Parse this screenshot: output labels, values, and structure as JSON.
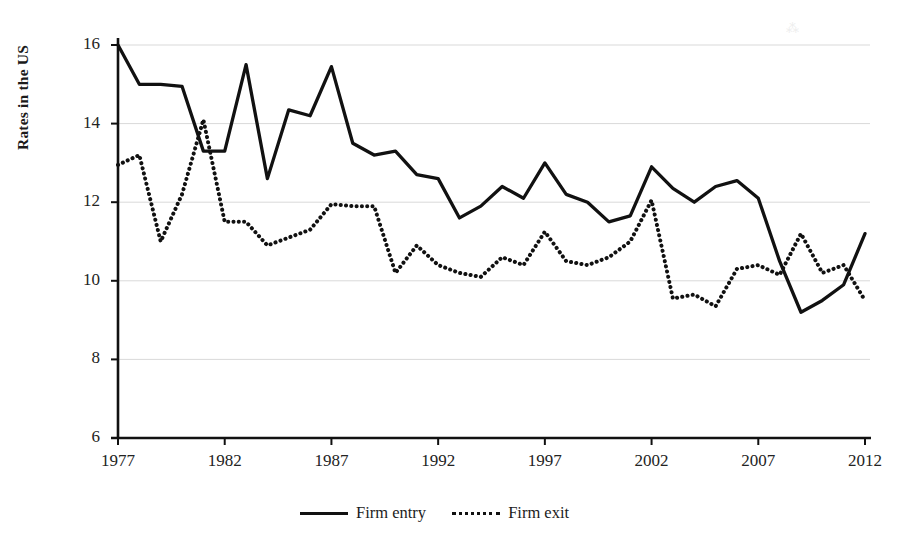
{
  "figure": {
    "background": "#ffffff",
    "ink_color": "#111111",
    "grid_color": "#d9d9d9",
    "axis_color": "#111111"
  },
  "axes": {
    "ylabel": "Rates in the US",
    "yticks": [
      6,
      8,
      10,
      12,
      14,
      16
    ],
    "xticks": [
      1977,
      1982,
      1987,
      1992,
      1997,
      2002,
      2007,
      2012
    ]
  },
  "legend": {
    "position": "bottom-center",
    "entries": [
      {
        "label": "Firm entry",
        "style": "solid",
        "color": "#111111"
      },
      {
        "label": "Firm exit",
        "style": "dotted",
        "color": "#111111"
      }
    ]
  },
  "artifact": {
    "glyph": "⁂"
  },
  "chart_data": {
    "type": "line",
    "title": "",
    "subtitle": "",
    "xlabel": "",
    "ylabel": "Rates in the US",
    "xlim": [
      1977,
      2012
    ],
    "ylim": [
      6,
      16
    ],
    "xticks": [
      1977,
      1982,
      1987,
      1992,
      1997,
      2002,
      2007,
      2012
    ],
    "yticks": [
      6,
      8,
      10,
      12,
      14,
      16
    ],
    "grid": "horizontal",
    "legend_position": "bottom-center",
    "x": [
      1977,
      1978,
      1979,
      1980,
      1981,
      1982,
      1983,
      1984,
      1985,
      1986,
      1987,
      1988,
      1989,
      1990,
      1991,
      1992,
      1993,
      1994,
      1995,
      1996,
      1997,
      1998,
      1999,
      2000,
      2001,
      2002,
      2003,
      2004,
      2005,
      2006,
      2007,
      2008,
      2009,
      2010,
      2011,
      2012
    ],
    "series": [
      {
        "name": "Firm entry",
        "style": "solid",
        "color": "#111111",
        "values": [
          16.0,
          15.0,
          15.0,
          14.95,
          13.3,
          13.3,
          15.5,
          12.6,
          14.35,
          14.2,
          15.45,
          13.5,
          13.2,
          13.3,
          12.7,
          12.6,
          11.6,
          11.9,
          12.4,
          12.1,
          13.0,
          12.2,
          12.0,
          11.5,
          11.65,
          12.9,
          12.35,
          12.0,
          12.4,
          12.55,
          12.1,
          10.5,
          9.2,
          9.5,
          9.9,
          11.2
        ]
      },
      {
        "name": "Firm exit",
        "style": "dotted",
        "color": "#111111",
        "values": [
          12.95,
          13.2,
          11.0,
          12.2,
          14.1,
          11.5,
          11.5,
          10.9,
          11.1,
          11.3,
          11.95,
          11.9,
          11.9,
          10.2,
          10.9,
          10.4,
          10.2,
          10.1,
          10.6,
          10.4,
          11.25,
          10.5,
          10.4,
          10.6,
          11.0,
          12.05,
          9.55,
          9.65,
          9.35,
          10.3,
          10.4,
          10.15,
          11.2,
          10.2,
          10.4,
          9.5
        ]
      }
    ]
  }
}
